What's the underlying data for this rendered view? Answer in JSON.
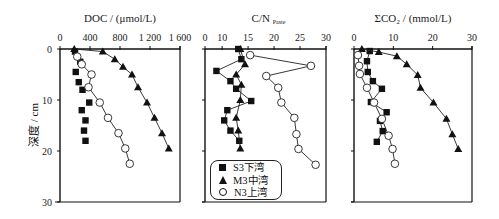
{
  "figure": {
    "ylabel": "深度 / cm",
    "yticks": [
      "0",
      "10",
      "20",
      "30"
    ]
  },
  "legend": {
    "items": [
      {
        "label": "S3下湾",
        "marker": "filled-square"
      },
      {
        "label": "M3中湾",
        "marker": "filled-triangle"
      },
      {
        "label": "N3上湾",
        "marker": "open-circle"
      }
    ]
  },
  "chart_data": [
    {
      "type": "line",
      "title": "DOC / (μmol/L)",
      "xlabel": "DOC / (μmol/L)",
      "ylabel": "深度 / cm",
      "xlim": [
        0,
        1600
      ],
      "ylim": [
        30,
        0
      ],
      "xticks": [
        "0",
        "400",
        "800",
        "1 200",
        "1 600"
      ],
      "xtick_values": [
        0,
        400,
        800,
        1200,
        1600
      ],
      "yticks": [
        0,
        10,
        20,
        30
      ],
      "grid": false,
      "series": [
        {
          "name": "S3下湾",
          "marker": "square",
          "lines": false,
          "points": [
            [
              200,
              0.5
            ],
            [
              270,
              2.5
            ],
            [
              210,
              4.5
            ],
            [
              250,
              6.5
            ],
            [
              300,
              8
            ],
            [
              390,
              10.5
            ],
            [
              290,
              12
            ],
            [
              340,
              14
            ],
            [
              320,
              16
            ],
            [
              340,
              18
            ]
          ]
        },
        {
          "name": "M3中湾",
          "marker": "triangle",
          "lines": true,
          "points": [
            [
              190,
              0
            ],
            [
              570,
              0.5
            ],
            [
              730,
              2
            ],
            [
              840,
              3.5
            ],
            [
              960,
              5
            ],
            [
              1040,
              7.5
            ],
            [
              1160,
              10.5
            ],
            [
              1260,
              13.5
            ],
            [
              1360,
              16.5
            ],
            [
              1450,
              19.5
            ]
          ]
        },
        {
          "name": "N3上湾",
          "marker": "circle",
          "lines": true,
          "points": [
            [
              230,
              1.5
            ],
            [
              290,
              3
            ],
            [
              420,
              5
            ],
            [
              380,
              7.5
            ],
            [
              530,
              10.5
            ],
            [
              640,
              13.5
            ],
            [
              780,
              16.5
            ],
            [
              870,
              19.5
            ],
            [
              930,
              22.5
            ]
          ]
        }
      ]
    },
    {
      "type": "line",
      "title": "C/N_Paste",
      "xlabel": "C/N",
      "xlabel_sub": "Paste",
      "ylabel": "深度 / cm",
      "xlim": [
        6.7,
        30
      ],
      "ylim": [
        30,
        0
      ],
      "xticks": [
        "0",
        "10",
        "15",
        "20",
        "25",
        "30"
      ],
      "xtick_values": [
        6.7,
        10,
        15,
        20,
        25,
        30
      ],
      "yticks": [
        0,
        10,
        20,
        30
      ],
      "grid": false,
      "series": [
        {
          "name": "S3下湾",
          "marker": "square",
          "lines": true,
          "points": [
            [
              13.1,
              0
            ],
            [
              13.7,
              2
            ],
            [
              8.9,
              4.3
            ],
            [
              11.6,
              6.3
            ],
            [
              12.7,
              7.8
            ],
            [
              15.6,
              10.2
            ],
            [
              11.0,
              12
            ],
            [
              10.4,
              14
            ],
            [
              11.6,
              16
            ],
            [
              13.3,
              18
            ]
          ]
        },
        {
          "name": "M3中湾",
          "marker": "triangle",
          "lines": true,
          "points": [
            [
              13.5,
              0
            ],
            [
              14.4,
              3
            ],
            [
              12.7,
              5
            ],
            [
              13.7,
              7
            ],
            [
              13.5,
              10
            ],
            [
              12.7,
              13.5
            ],
            [
              13.1,
              16
            ],
            [
              13.5,
              19.5
            ]
          ]
        },
        {
          "name": "N3上湾",
          "marker": "circle",
          "lines": true,
          "points": [
            [
              15.4,
              1.2
            ],
            [
              27.1,
              3.3
            ],
            [
              18.5,
              5.3
            ],
            [
              20.8,
              7.6
            ],
            [
              21.4,
              10.5
            ],
            [
              23.9,
              13.5
            ],
            [
              24.3,
              16.7
            ],
            [
              24.7,
              19.6
            ],
            [
              28.0,
              22.7
            ]
          ]
        }
      ]
    },
    {
      "type": "line",
      "title": "ΣCO₂ / (mmol/L)",
      "xlabel": "ΣCO₂ / (mmol/L)",
      "ylabel": "深度 / cm",
      "xlim": [
        0,
        30
      ],
      "ylim": [
        30,
        0
      ],
      "xticks": [
        "0",
        "10",
        "20",
        "30"
      ],
      "xtick_values": [
        0,
        10,
        20,
        30
      ],
      "yticks": [
        0,
        10,
        20,
        30
      ],
      "grid": false,
      "series": [
        {
          "name": "S3下湾",
          "marker": "square",
          "lines": true,
          "points": [
            [
              4.0,
              0.4
            ],
            [
              3.3,
              2.4
            ],
            [
              3.5,
              4.5
            ],
            [
              4.8,
              6.3
            ],
            [
              7.1,
              7.8
            ],
            [
              4.3,
              10.4
            ],
            [
              8.3,
              12.4
            ],
            [
              6.6,
              14.1
            ],
            [
              7.3,
              16.1
            ],
            [
              5.8,
              18.2
            ]
          ]
        },
        {
          "name": "M3中湾",
          "marker": "triangle",
          "lines": true,
          "points": [
            [
              2.0,
              0
            ],
            [
              6.3,
              0.6
            ],
            [
              10.9,
              1.4
            ],
            [
              13.4,
              3
            ],
            [
              16.2,
              5.1
            ],
            [
              16.9,
              7.6
            ],
            [
              20.2,
              10.5
            ],
            [
              23.5,
              13.7
            ],
            [
              25.0,
              16.7
            ],
            [
              26.5,
              19.6
            ]
          ]
        },
        {
          "name": "N3上湾",
          "marker": "circle",
          "lines": true,
          "points": [
            [
              1.0,
              1.2
            ],
            [
              1.3,
              3.3
            ],
            [
              1.5,
              4.9
            ],
            [
              3.3,
              7.6
            ],
            [
              5.1,
              10.5
            ],
            [
              7.1,
              13.7
            ],
            [
              8.8,
              17
            ],
            [
              9.8,
              19.6
            ],
            [
              10.4,
              22.5
            ]
          ]
        }
      ]
    }
  ]
}
